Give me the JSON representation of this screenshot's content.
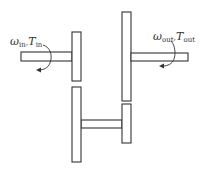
{
  "diagram": {
    "type": "gear-train-schematic",
    "input": {
      "omega_symbol": "ω",
      "omega_sub": "in",
      "torque_symbol": "T",
      "torque_sub": "in",
      "separator": ","
    },
    "output": {
      "omega_symbol": "ω",
      "omega_sub": "out",
      "torque_symbol": "T",
      "torque_sub": "out",
      "separator": ","
    },
    "components": [
      {
        "name": "input-shaft",
        "x": 21,
        "y": 52,
        "w": 51,
        "h": 9
      },
      {
        "name": "input-gear",
        "x": 72,
        "y": 32,
        "w": 9,
        "h": 49
      },
      {
        "name": "output-gear",
        "x": 122,
        "y": 12,
        "w": 9,
        "h": 89
      },
      {
        "name": "output-shaft",
        "x": 131,
        "y": 53,
        "w": 57,
        "h": 8
      },
      {
        "name": "countershaft-gear-large",
        "x": 72,
        "y": 87,
        "w": 9,
        "h": 75
      },
      {
        "name": "countershaft-gear-small",
        "x": 122,
        "y": 104,
        "w": 9,
        "h": 39
      },
      {
        "name": "countershaft",
        "x": 81,
        "y": 120,
        "w": 41,
        "h": 8
      }
    ],
    "colors": {
      "stroke": "#333333",
      "fill": "#ffffff",
      "background": "#ffffff"
    }
  }
}
